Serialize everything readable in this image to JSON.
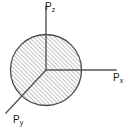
{
  "figure": {
    "name": "momentum-space-sphere",
    "background_color": "#ffffff",
    "axis_color": "#555555",
    "outline_color": "#4a4a4a",
    "hatch_color": "#8c8c8c",
    "label_color": "#1a1a1a"
  },
  "sphere": {
    "center_x": 46,
    "center_y": 70,
    "radius": 36,
    "fill": "hatched",
    "hatch_angle_deg": 45,
    "hatch_spacing_px": 3
  },
  "axes": [
    {
      "id": "pz",
      "symbol": "P",
      "subscript": "z",
      "label": "Pz",
      "direction": "up",
      "start_x": 46,
      "start_y": 70,
      "end_x": 46,
      "end_y": 6
    },
    {
      "id": "px",
      "symbol": "P",
      "subscript": "x",
      "label": "Px",
      "direction": "right",
      "start_x": 46,
      "start_y": 70,
      "end_x": 116,
      "end_y": 70
    },
    {
      "id": "py",
      "symbol": "P",
      "subscript": "y",
      "label": "Py",
      "direction": "down-left",
      "start_x": 46,
      "start_y": 70,
      "end_x": 6,
      "end_y": 113
    }
  ],
  "labels": {
    "pz": {
      "symbol": "P",
      "subscript": "z"
    },
    "px": {
      "symbol": "P",
      "subscript": "x"
    },
    "py": {
      "symbol": "P",
      "subscript": "y"
    }
  }
}
